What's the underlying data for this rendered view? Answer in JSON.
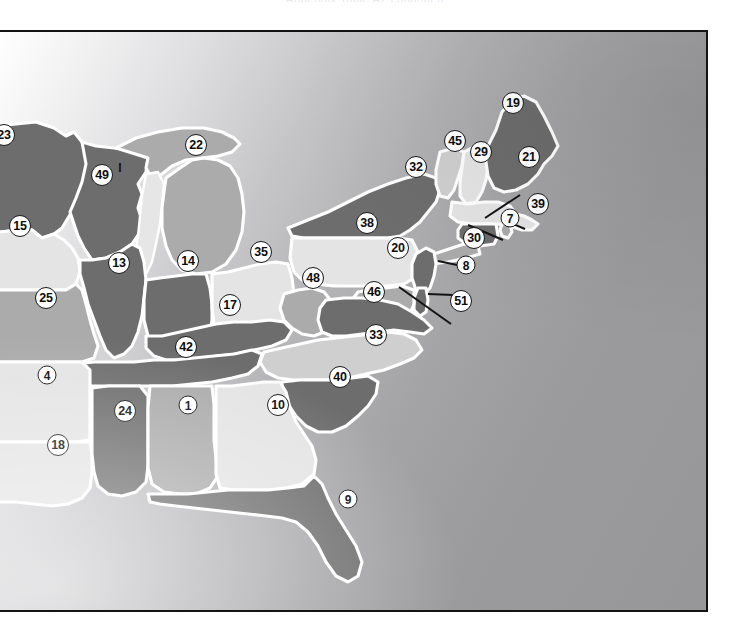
{
  "page": {
    "top_caption": "Appendix  Table  A2  continued",
    "background": "#ffffff"
  },
  "map": {
    "title": "Eastern United States choropleth map with numbered state labels",
    "frame_border_color": "#141414",
    "projection_note": "Eastern half of the contiguous United States",
    "fill_palette": {
      "very_light": "#e3e3e3",
      "light": "#cfcfcf",
      "medium": "#aeaeae",
      "dark": "#6e6e6e",
      "border_white": "#ffffff"
    },
    "labels": [
      {
        "id": "23",
        "value": "23",
        "x": 2,
        "y": 133,
        "state": "Minnesota",
        "shade": "dark",
        "clipped": true
      },
      {
        "id": "49",
        "value": "49",
        "x": 100,
        "y": 173,
        "state": "Wisconsin",
        "shade": "dark",
        "clipped": false
      },
      {
        "id": "22",
        "value": "22",
        "x": 194,
        "y": 143,
        "state": "Michigan",
        "shade": "medium",
        "clipped": false
      },
      {
        "id": "15",
        "value": "15",
        "x": 18,
        "y": 224,
        "state": "Iowa",
        "shade": "very_light",
        "clipped": false
      },
      {
        "id": "13",
        "value": "13",
        "x": 117,
        "y": 261,
        "state": "Illinois",
        "shade": "dark",
        "clipped": false
      },
      {
        "id": "14",
        "value": "14",
        "x": 186,
        "y": 259,
        "state": "Indiana",
        "shade": "dark",
        "clipped": false
      },
      {
        "id": "35",
        "value": "35",
        "x": 259,
        "y": 250,
        "state": "Ohio",
        "shade": "very_light",
        "clipped": false
      },
      {
        "id": "38",
        "value": "38",
        "x": 365,
        "y": 221,
        "state": "Pennsylvania",
        "shade": "very_light",
        "clipped": false
      },
      {
        "id": "32",
        "value": "32",
        "x": 414,
        "y": 165,
        "state": "New York",
        "shade": "dark",
        "clipped": false
      },
      {
        "id": "45",
        "value": "45",
        "x": 453,
        "y": 139,
        "state": "Vermont",
        "shade": "light",
        "clipped": false
      },
      {
        "id": "29",
        "value": "29",
        "x": 479,
        "y": 150,
        "state": "New Hampshire",
        "shade": "very_light",
        "clipped": false
      },
      {
        "id": "19",
        "value": "19",
        "x": 511,
        "y": 101,
        "state": "Maine",
        "shade": "dark",
        "clipped": false
      },
      {
        "id": "21",
        "value": "21",
        "x": 527,
        "y": 155,
        "state": "Massachusetts",
        "shade": "very_light",
        "clipped": false
      },
      {
        "id": "39",
        "value": "39",
        "x": 536,
        "y": 202,
        "state": "Rhode Island",
        "shade": "medium",
        "clipped": false
      },
      {
        "id": "7",
        "value": "7",
        "x": 508,
        "y": 216,
        "state": "Connecticut",
        "shade": "dark",
        "clipped": false
      },
      {
        "id": "30",
        "value": "30",
        "x": 472,
        "y": 236,
        "state": "New Jersey",
        "shade": "dark",
        "clipped": false
      },
      {
        "id": "20",
        "value": "20",
        "x": 396,
        "y": 246,
        "state": "Maryland",
        "shade": "medium",
        "clipped": false
      },
      {
        "id": "8",
        "value": "8",
        "x": 464,
        "y": 263,
        "state": "Delaware",
        "shade": "dark",
        "clipped": false
      },
      {
        "id": "51",
        "value": "51",
        "x": 459,
        "y": 299,
        "state": "District of Columbia",
        "shade": "dark",
        "clipped": false
      },
      {
        "id": "48",
        "value": "48",
        "x": 311,
        "y": 276,
        "state": "West Virginia",
        "shade": "medium",
        "clipped": false
      },
      {
        "id": "46",
        "value": "46",
        "x": 372,
        "y": 290,
        "state": "Virginia",
        "shade": "dark",
        "clipped": false
      },
      {
        "id": "17",
        "value": "17",
        "x": 228,
        "y": 303,
        "state": "Kentucky",
        "shade": "dark",
        "clipped": false
      },
      {
        "id": "25",
        "value": "25",
        "x": 44,
        "y": 296,
        "state": "Missouri",
        "shade": "medium",
        "clipped": false
      },
      {
        "id": "42",
        "value": "42",
        "x": 184,
        "y": 345,
        "state": "Tennessee",
        "shade": "dark",
        "clipped": false
      },
      {
        "id": "33",
        "value": "33",
        "x": 374,
        "y": 333,
        "state": "North Carolina",
        "shade": "light",
        "clipped": false
      },
      {
        "id": "4",
        "value": "4",
        "x": 45,
        "y": 373,
        "state": "Arkansas",
        "shade": "very_light",
        "clipped": false
      },
      {
        "id": "40",
        "value": "40",
        "x": 338,
        "y": 375,
        "state": "South Carolina",
        "shade": "dark",
        "clipped": false
      },
      {
        "id": "24",
        "value": "24",
        "x": 123,
        "y": 409,
        "state": "Mississippi",
        "shade": "dark",
        "clipped": false
      },
      {
        "id": "1",
        "value": "1",
        "x": 186,
        "y": 403,
        "state": "Alabama",
        "shade": "medium",
        "clipped": false
      },
      {
        "id": "10",
        "value": "10",
        "x": 276,
        "y": 403,
        "state": "Georgia",
        "shade": "very_light",
        "clipped": false
      },
      {
        "id": "18",
        "value": "18",
        "x": 56,
        "y": 443,
        "state": "Louisiana",
        "shade": "very_light",
        "clipped": false
      },
      {
        "id": "9",
        "value": "9",
        "x": 346,
        "y": 497,
        "state": "Florida",
        "shade": "dark",
        "clipped": false
      }
    ],
    "tick_marks": [
      {
        "id": "wisconsin-tick",
        "value": "I",
        "x": 118,
        "y": 166
      }
    ],
    "leaders": [
      {
        "id": "leader-21",
        "from_x": 518,
        "from_y": 163,
        "to_x": 489,
        "to_y": 186
      },
      {
        "id": "leader-39",
        "from_x": 529,
        "from_y": 195,
        "to_x": 505,
        "to_y": 187
      },
      {
        "id": "leader-7",
        "from_x": 503,
        "from_y": 208,
        "to_x": 470,
        "to_y": 192
      },
      {
        "id": "leader-30",
        "from_x": 463,
        "from_y": 234,
        "to_x": 440,
        "to_y": 229
      },
      {
        "id": "leader-8",
        "from_x": 455,
        "from_y": 263,
        "to_x": 431,
        "to_y": 262
      },
      {
        "id": "leader-51",
        "from_x": 452,
        "from_y": 293,
        "to_x": 402,
        "to_y": 255
      }
    ]
  }
}
